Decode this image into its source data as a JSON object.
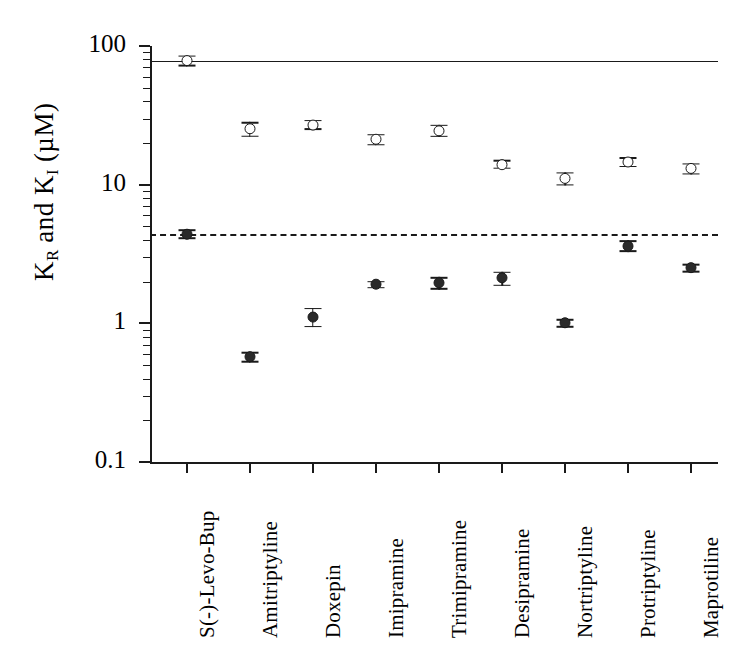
{
  "chart_data": {
    "type": "scatter",
    "title": "",
    "xlabel": "",
    "ylabel": "K_R and K_I (uM)",
    "ylabel_parts": {
      "k1": "K",
      "sub1": "R",
      "and": " and ",
      "k2": "K",
      "sub2": "I",
      "units": " (µM)"
    },
    "yscale": "log",
    "ylim": [
      0.1,
      100
    ],
    "ytick_labels": [
      "0.1",
      "1",
      "10",
      "100"
    ],
    "ytick_values": [
      0.1,
      1,
      10,
      100
    ],
    "grid": false,
    "legend": "none",
    "categories": [
      "S(-)-Levo-Bup",
      "Amitriptyline",
      "Doxepin",
      "Imipramine",
      "Trimipramine",
      "Desipramine",
      "Nortriptyline",
      "Protriptyline",
      "Maprotiline"
    ],
    "series": [
      {
        "name": "K_R (open circles)",
        "marker": "open-circle",
        "values": [
          78.0,
          25.0,
          27.0,
          21.0,
          24.5,
          14.0,
          11.0,
          14.5,
          13.0
        ],
        "err_low": [
          7.0,
          3.0,
          2.2,
          2.0,
          2.5,
          1.0,
          1.2,
          1.2,
          1.2
        ],
        "err_high": [
          7.0,
          3.0,
          2.2,
          2.0,
          2.5,
          1.0,
          1.2,
          1.2,
          1.2
        ]
      },
      {
        "name": "K_I (filled circles)",
        "marker": "filled-circle",
        "values": [
          4.4,
          0.57,
          1.1,
          1.9,
          1.95,
          2.1,
          1.0,
          3.6,
          2.5
        ],
        "err_low": [
          0.35,
          0.05,
          0.18,
          0.12,
          0.2,
          0.25,
          0.07,
          0.35,
          0.18
        ],
        "err_high": [
          0.35,
          0.05,
          0.18,
          0.12,
          0.2,
          0.25,
          0.07,
          0.35,
          0.18
        ]
      }
    ],
    "reference_lines": [
      {
        "name": "solid-reference-line",
        "value": 78.0,
        "style": "solid"
      },
      {
        "name": "dashed-reference-line",
        "value": 4.4,
        "style": "dashed"
      }
    ],
    "colors": {
      "ink": "#1a1a1a",
      "background": "#ffffff"
    }
  }
}
